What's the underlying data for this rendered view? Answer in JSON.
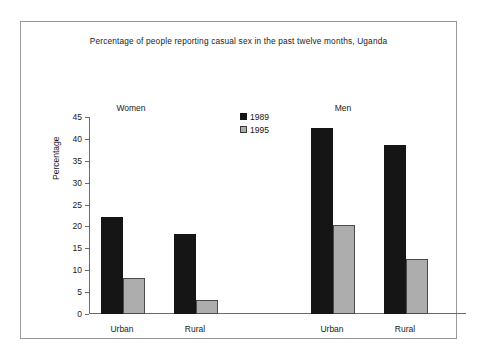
{
  "chart_data": {
    "type": "bar",
    "title": "Percentage of people reporting casual sex in the past twelve months, Uganda",
    "xlabel": "",
    "ylabel": "Percentage",
    "ylim": [
      0,
      45
    ],
    "yticks": [
      0,
      5,
      10,
      15,
      20,
      25,
      30,
      35,
      40,
      45
    ],
    "grid": false,
    "legend_position": "top-center",
    "categories": [
      "Urban",
      "Rural",
      "Urban",
      "Rural"
    ],
    "group_labels": [
      "Women",
      "Men"
    ],
    "series": [
      {
        "name": "1989",
        "color": "#151515",
        "values": [
          22.1,
          18.2,
          42.6,
          38.6
        ]
      },
      {
        "name": "1995",
        "color": "#adadad",
        "values": [
          8.2,
          3.2,
          20.3,
          12.6
        ]
      }
    ],
    "groups": [
      {
        "label": "Women",
        "categories": [
          {
            "label": "Urban",
            "values": {
              "1989": 22.1,
              "1995": 8.2
            }
          },
          {
            "label": "Rural",
            "values": {
              "1989": 18.2,
              "1995": 3.2
            }
          }
        ]
      },
      {
        "label": "Men",
        "categories": [
          {
            "label": "Urban",
            "values": {
              "1989": 42.6,
              "1995": 20.3
            }
          },
          {
            "label": "Rural",
            "values": {
              "1989": 38.6,
              "1995": 12.6
            }
          }
        ]
      }
    ]
  },
  "legend": {
    "items": [
      {
        "label": "1989",
        "color": "#151515"
      },
      {
        "label": "1995",
        "color": "#adadad"
      }
    ]
  },
  "axis": {
    "y_tick_labels": [
      "45",
      "40",
      "35",
      "30",
      "25",
      "20",
      "15",
      "10",
      "5",
      "0"
    ],
    "y_title": "Percentage",
    "x_tick_labels": [
      "Urban",
      "Rural",
      "Urban",
      "Rural"
    ]
  },
  "colors": {
    "series_1989": "#151515",
    "series_1995": "#adadad",
    "axis": "#6b6b6b",
    "frame": "#9a9a9a",
    "text": "#1a1a1a",
    "background": "#ffffff"
  }
}
